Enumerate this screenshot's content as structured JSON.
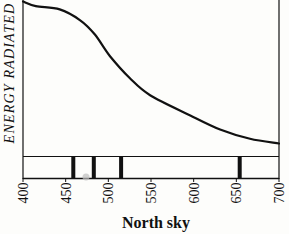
{
  "chart_data": {
    "type": "line",
    "title": "",
    "xlabel": "North sky",
    "ylabel": "ENERGY RADIATED",
    "xlim": [
      400,
      700
    ],
    "ylim": [
      0,
      100
    ],
    "x_unit": "nm",
    "y_unit": "relative (unlabeled)",
    "grid": false,
    "legend": null,
    "x_ticks": [
      400,
      450,
      500,
      550,
      600,
      650,
      700
    ],
    "x_tick_labels": [
      "400",
      "450",
      "500",
      "550",
      "600",
      "650",
      "700"
    ],
    "series": [
      {
        "name": "North sky spectrum",
        "x": [
          400,
          415,
          443,
          467,
          484,
          502,
          525,
          549,
          596,
          631,
          666,
          700
        ],
        "values": [
          99,
          96,
          94,
          87,
          78,
          64,
          50,
          39,
          26,
          17,
          11,
          8
        ]
      }
    ],
    "spectral_lines": {
      "description": "Emission/absorption line strip below the curve",
      "wavelengths": [
        459,
        483,
        515,
        654
      ]
    }
  },
  "labels": {
    "ylabel": "ENERGY RADIATED",
    "xlabel": "North sky",
    "ticks": [
      "400",
      "450",
      "500",
      "550",
      "600",
      "650",
      "700"
    ]
  },
  "colors": {
    "ink": "#111111",
    "background": "#fdfdfb"
  }
}
